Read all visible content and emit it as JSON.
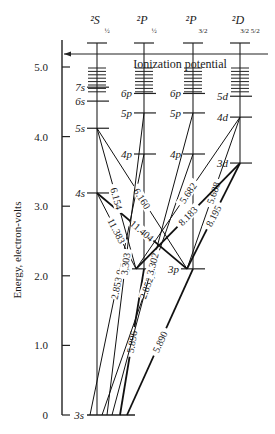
{
  "diagram": {
    "ylabel": "Energy, electron-volts",
    "yticks": [
      {
        "value": 0,
        "label": "0"
      },
      {
        "value": 1.0,
        "label": "1.0"
      },
      {
        "value": 2.0,
        "label": "2.0"
      },
      {
        "value": 3.0,
        "label": "3.0"
      },
      {
        "value": 4.0,
        "label": "4.0"
      },
      {
        "value": 5.0,
        "label": "5.0"
      }
    ],
    "ylim": [
      0,
      5.3
    ],
    "ionization": {
      "label": "Ionization potential",
      "value": 5.14
    },
    "columns": [
      {
        "id": "S",
        "term": "2S",
        "j": "1/2",
        "header_main": "²S",
        "header_sub": "½"
      },
      {
        "id": "P1",
        "term": "2P",
        "j": "1/2",
        "header_main": "²P",
        "header_sub": "½"
      },
      {
        "id": "P3",
        "term": "2P",
        "j": "3/2",
        "header_main": "²P",
        "header_sub": "3/2"
      },
      {
        "id": "D",
        "term": "2D",
        "j": "3/2 5/2",
        "header_main": "²D",
        "header_sub": "3/2 5/2"
      }
    ],
    "levels": [
      {
        "col": "S",
        "label": "3s",
        "energy": 0.0
      },
      {
        "col": "S",
        "label": "4s",
        "energy": 3.19
      },
      {
        "col": "S",
        "label": "5s",
        "energy": 4.12
      },
      {
        "col": "S",
        "label": "6s",
        "energy": 4.51
      },
      {
        "col": "S",
        "label": "7s",
        "energy": 4.71
      },
      {
        "col": "P1",
        "label": "3p",
        "energy": 2.1
      },
      {
        "col": "P1",
        "label": "4p",
        "energy": 3.75
      },
      {
        "col": "P1",
        "label": "5p",
        "energy": 4.34
      },
      {
        "col": "P1",
        "label": "6p",
        "energy": 4.62
      },
      {
        "col": "P3",
        "label": "3p",
        "energy": 2.1
      },
      {
        "col": "P3",
        "label": "4p",
        "energy": 3.75
      },
      {
        "col": "P3",
        "label": "5p",
        "energy": 4.34
      },
      {
        "col": "P3",
        "label": "6p",
        "energy": 4.62
      },
      {
        "col": "D",
        "label": "3d",
        "energy": 3.62
      },
      {
        "col": "D",
        "label": "4d",
        "energy": 4.28
      },
      {
        "col": "D",
        "label": "5d",
        "energy": 4.58
      }
    ],
    "transitions": [
      {
        "label": "5.890",
        "from": {
          "col": "P3",
          "e": 2.1
        },
        "to": {
          "col": "S",
          "e": 0.0
        },
        "bold": true
      },
      {
        "label": "5.896",
        "from": {
          "col": "P1",
          "e": 2.1
        },
        "to": {
          "col": "S",
          "e": 0.0
        },
        "bold": true
      },
      {
        "label": "2.852,8",
        "from": {
          "col": "P3",
          "e": 3.75
        },
        "to": {
          "col": "S",
          "e": 0.0
        },
        "bold": false
      },
      {
        "label": "2.853,0",
        "from": {
          "col": "P1",
          "e": 3.75
        },
        "to": {
          "col": "S",
          "e": 0.0
        },
        "bold": false
      },
      {
        "label": "11.383",
        "from": {
          "col": "S",
          "e": 3.19
        },
        "to": {
          "col": "P1",
          "e": 2.1
        },
        "bold": false
      },
      {
        "label": "11.404",
        "from": {
          "col": "S",
          "e": 3.19
        },
        "to": {
          "col": "P3",
          "e": 2.1
        },
        "bold": true
      },
      {
        "label": "6.154",
        "from": {
          "col": "S",
          "e": 4.12
        },
        "to": {
          "col": "P1",
          "e": 2.1
        },
        "bold": false
      },
      {
        "label": "6.160",
        "from": {
          "col": "S",
          "e": 4.12
        },
        "to": {
          "col": "P3",
          "e": 2.1
        },
        "bold": false
      },
      {
        "label": "3.303",
        "from": {
          "col": "P1",
          "e": 4.34
        },
        "to": {
          "col": "S",
          "e": 0.0
        },
        "bold": false
      },
      {
        "label": "3.302",
        "from": {
          "col": "P3",
          "e": 4.34
        },
        "to": {
          "col": "S",
          "e": 0.0
        },
        "bold": false
      },
      {
        "label": "5.682",
        "from": {
          "col": "D",
          "e": 4.28
        },
        "to": {
          "col": "P1",
          "e": 2.1
        },
        "bold": false
      },
      {
        "label": "5.688",
        "from": {
          "col": "D",
          "e": 4.28
        },
        "to": {
          "col": "P3",
          "e": 2.1
        },
        "bold": false
      },
      {
        "label": "8.183",
        "from": {
          "col": "D",
          "e": 3.62
        },
        "to": {
          "col": "P1",
          "e": 2.1
        },
        "bold": true
      },
      {
        "label": "8.195",
        "from": {
          "col": "D",
          "e": 3.62
        },
        "to": {
          "col": "P3",
          "e": 2.1
        },
        "bold": true
      }
    ]
  }
}
